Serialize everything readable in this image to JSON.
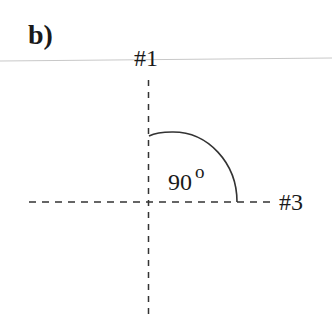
{
  "panel_label": "b)",
  "axes": [
    {
      "id": "axis-1",
      "label": "#1",
      "orientation": "vertical"
    },
    {
      "id": "axis-3",
      "label": "#3",
      "orientation": "horizontal"
    }
  ],
  "angle": {
    "value": "90",
    "unit": "o"
  },
  "colors": {
    "line": "#333333",
    "rule": "#c8c8c8",
    "text": "#1a1a1a"
  }
}
